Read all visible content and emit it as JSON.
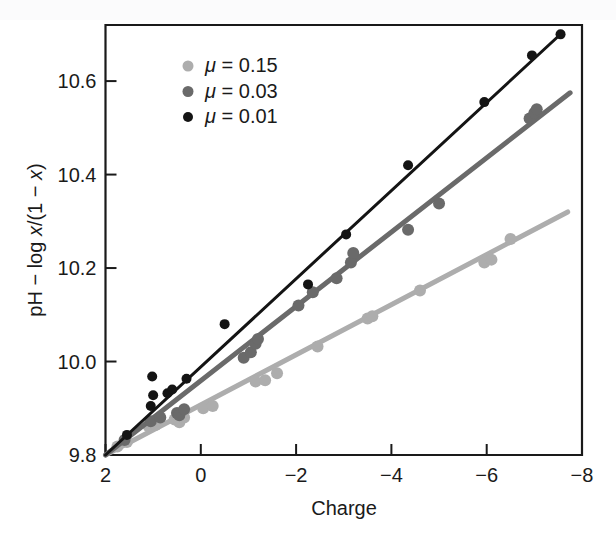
{
  "figure": {
    "background_color": "#ffffff",
    "axis_color": "#1a1a1a"
  },
  "chart_data": {
    "type": "scatter",
    "title": "",
    "subtitle": "",
    "xlabel": "Charge",
    "ylabel": "pH − log x/(1 − x)",
    "ylabel_parts": {
      "prefix": "pH − log ",
      "var1": "x",
      "middle": "/(1 − ",
      "var2": "x",
      "suffix": ")"
    },
    "xlim": [
      2,
      -8
    ],
    "ylim": [
      9.8,
      10.72
    ],
    "x_reversed": true,
    "xticks": [
      2,
      0,
      -2,
      -4,
      -6,
      -8
    ],
    "xtick_labels": [
      "2",
      "0",
      "−2",
      "−4",
      "−6",
      "−8"
    ],
    "yticks": [
      9.8,
      10.0,
      10.2,
      10.4,
      10.6
    ],
    "ytick_labels": [
      "9.8",
      "10.0",
      "10.2",
      "10.4",
      "10.6"
    ],
    "grid": false,
    "legend_position": "upper-left",
    "legend_entries": [
      {
        "label": "μ = 0.15",
        "mu_symbol": "μ",
        "value": "0.15",
        "color": "#adadad"
      },
      {
        "label": "μ = 0.03",
        "mu_symbol": "μ",
        "value": "0.03",
        "color": "#6a6a6a"
      },
      {
        "label": "μ = 0.01",
        "mu_symbol": "μ",
        "value": "0.01",
        "color": "#141414"
      }
    ],
    "series": [
      {
        "name": "μ = 0.15",
        "mu": 0.15,
        "color": "#adadad",
        "marker": "circle",
        "marker_size": 9,
        "line_width": 5,
        "fit_line": {
          "x0": 2,
          "y0": 9.8,
          "x1": -7.7,
          "y1": 10.32
        },
        "points": [
          {
            "x": 1.75,
            "y": 9.818
          },
          {
            "x": 1.55,
            "y": 9.828
          },
          {
            "x": 1.1,
            "y": 9.862
          },
          {
            "x": 0.95,
            "y": 9.864
          },
          {
            "x": 0.55,
            "y": 9.876
          },
          {
            "x": 0.45,
            "y": 9.87
          },
          {
            "x": 0.35,
            "y": 9.88
          },
          {
            "x": -0.05,
            "y": 9.9
          },
          {
            "x": -0.25,
            "y": 9.905
          },
          {
            "x": -1.15,
            "y": 9.957
          },
          {
            "x": -1.35,
            "y": 9.96
          },
          {
            "x": -1.6,
            "y": 9.975
          },
          {
            "x": -2.45,
            "y": 10.032
          },
          {
            "x": -3.5,
            "y": 10.092
          },
          {
            "x": -3.6,
            "y": 10.097
          },
          {
            "x": -4.6,
            "y": 10.152
          },
          {
            "x": -5.95,
            "y": 10.212
          },
          {
            "x": -6.1,
            "y": 10.218
          },
          {
            "x": -6.5,
            "y": 10.262
          }
        ]
      },
      {
        "name": "μ = 0.03",
        "mu": 0.03,
        "color": "#6a6a6a",
        "marker": "circle",
        "marker_size": 9,
        "line_width": 5,
        "fit_line": {
          "x0": 2,
          "y0": 9.8,
          "x1": -7.75,
          "y1": 10.575
        },
        "points": [
          {
            "x": 1.6,
            "y": 9.832
          },
          {
            "x": 1.05,
            "y": 9.872
          },
          {
            "x": 0.85,
            "y": 9.88
          },
          {
            "x": 0.5,
            "y": 9.89
          },
          {
            "x": 0.45,
            "y": 9.885
          },
          {
            "x": 0.35,
            "y": 9.898
          },
          {
            "x": -0.9,
            "y": 10.008
          },
          {
            "x": -1.05,
            "y": 10.02
          },
          {
            "x": -1.15,
            "y": 10.038
          },
          {
            "x": -1.2,
            "y": 10.048
          },
          {
            "x": -2.05,
            "y": 10.12
          },
          {
            "x": -2.35,
            "y": 10.148
          },
          {
            "x": -2.85,
            "y": 10.178
          },
          {
            "x": -3.15,
            "y": 10.212
          },
          {
            "x": -3.2,
            "y": 10.232
          },
          {
            "x": -4.35,
            "y": 10.282
          },
          {
            "x": -5.0,
            "y": 10.338
          },
          {
            "x": -6.9,
            "y": 10.52
          },
          {
            "x": -7.0,
            "y": 10.532
          },
          {
            "x": -7.05,
            "y": 10.54
          }
        ]
      },
      {
        "name": "μ = 0.01",
        "mu": 0.01,
        "color": "#141414",
        "marker": "circle",
        "marker_size": 7,
        "line_width": 3,
        "fit_line": {
          "x0": 2,
          "y0": 9.8,
          "x1": -7.6,
          "y1": 10.705
        },
        "points": [
          {
            "x": 1.55,
            "y": 9.843
          },
          {
            "x": 1.05,
            "y": 9.905
          },
          {
            "x": 1.0,
            "y": 9.928
          },
          {
            "x": 1.02,
            "y": 9.968
          },
          {
            "x": 0.7,
            "y": 9.932
          },
          {
            "x": 0.6,
            "y": 9.94
          },
          {
            "x": 0.3,
            "y": 9.963
          },
          {
            "x": -0.5,
            "y": 10.08
          },
          {
            "x": -2.25,
            "y": 10.165
          },
          {
            "x": -3.05,
            "y": 10.272
          },
          {
            "x": -4.35,
            "y": 10.42
          },
          {
            "x": -5.95,
            "y": 10.555
          },
          {
            "x": -6.95,
            "y": 10.655
          },
          {
            "x": -7.55,
            "y": 10.7
          }
        ]
      }
    ]
  }
}
